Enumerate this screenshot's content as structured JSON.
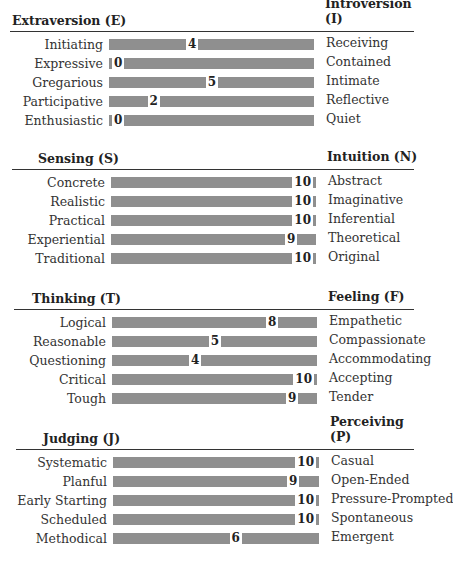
{
  "chart_data": [
    {
      "type": "bar",
      "title": "Extraversion (E) vs Introversion (I)",
      "left_pole": "Extraversion (E)",
      "right_pole": "Introversion (I)",
      "scale": [
        0,
        10
      ],
      "categories_left": [
        "Initiating",
        "Expressive",
        "Gregarious",
        "Participative",
        "Enthusiastic"
      ],
      "categories_right": [
        "Receiving",
        "Contained",
        "Intimate",
        "Reflective",
        "Quiet"
      ],
      "values": [
        4,
        0,
        5,
        2,
        0
      ]
    },
    {
      "type": "bar",
      "title": "Sensing (S) vs Intuition (N)",
      "left_pole": "Sensing (S)",
      "right_pole": "Intuition (N)",
      "scale": [
        0,
        10
      ],
      "categories_left": [
        "Concrete",
        "Realistic",
        "Practical",
        "Experiential",
        "Traditional"
      ],
      "categories_right": [
        "Abstract",
        "Imaginative",
        "Inferential",
        "Theoretical",
        "Original"
      ],
      "values": [
        10,
        10,
        10,
        9,
        10
      ]
    },
    {
      "type": "bar",
      "title": "Thinking (T) vs Feeling (F)",
      "left_pole": "Thinking (T)",
      "right_pole": "Feeling (F)",
      "scale": [
        0,
        10
      ],
      "categories_left": [
        "Logical",
        "Reasonable",
        "Questioning",
        "Critical",
        "Tough"
      ],
      "categories_right": [
        "Empathetic",
        "Compassionate",
        "Accommodating",
        "Accepting",
        "Tender"
      ],
      "values": [
        8,
        5,
        4,
        10,
        9
      ]
    },
    {
      "type": "bar",
      "title": "Judging (J) vs Perceiving (P)",
      "left_pole": "Judging (J)",
      "right_pole": "Perceiving (P)",
      "scale": [
        0,
        10
      ],
      "categories_left": [
        "Systematic",
        "Planful",
        "Early Starting",
        "Scheduled",
        "Methodical"
      ],
      "categories_right": [
        "Casual",
        "Open-Ended",
        "Pressure-Prompted",
        "Spontaneous",
        "Emergent"
      ],
      "values": [
        10,
        9,
        10,
        10,
        6
      ]
    }
  ],
  "colors": {
    "bar": "#8f8f8f",
    "text": "#333333",
    "divider": "#333333"
  },
  "sections": [
    {
      "left": "Extraversion (E)",
      "right": "Introversion (I)",
      "rows": [
        {
          "l": "Initiating",
          "r": "Receiving",
          "v": "4"
        },
        {
          "l": "Expressive",
          "r": "Contained",
          "v": "0"
        },
        {
          "l": "Gregarious",
          "r": "Intimate",
          "v": "5"
        },
        {
          "l": "Participative",
          "r": "Reflective",
          "v": "2"
        },
        {
          "l": "Enthusiastic",
          "r": "Quiet",
          "v": "0"
        }
      ]
    },
    {
      "left": "Sensing (S)",
      "right": "Intuition (N)",
      "rows": [
        {
          "l": "Concrete",
          "r": "Abstract",
          "v": "10"
        },
        {
          "l": "Realistic",
          "r": "Imaginative",
          "v": "10"
        },
        {
          "l": "Practical",
          "r": "Inferential",
          "v": "10"
        },
        {
          "l": "Experiential",
          "r": "Theoretical",
          "v": "9"
        },
        {
          "l": "Traditional",
          "r": "Original",
          "v": "10"
        }
      ]
    },
    {
      "left": "Thinking (T)",
      "right": "Feeling (F)",
      "rows": [
        {
          "l": "Logical",
          "r": "Empathetic",
          "v": "8"
        },
        {
          "l": "Reasonable",
          "r": "Compassionate",
          "v": "5"
        },
        {
          "l": "Questioning",
          "r": "Accommodating",
          "v": "4"
        },
        {
          "l": "Critical",
          "r": "Accepting",
          "v": "10"
        },
        {
          "l": "Tough",
          "r": "Tender",
          "v": "9"
        }
      ]
    },
    {
      "left": "Judging (J)",
      "right": "Perceiving (P)",
      "rows": [
        {
          "l": "Systematic",
          "r": "Casual",
          "v": "10"
        },
        {
          "l": "Planful",
          "r": "Open-Ended",
          "v": "9"
        },
        {
          "l": "Early Starting",
          "r": "Pressure-Prompted",
          "v": "10"
        },
        {
          "l": "Scheduled",
          "r": "Spontaneous",
          "v": "10"
        },
        {
          "l": "Methodical",
          "r": "Emergent",
          "v": "6"
        }
      ]
    }
  ]
}
